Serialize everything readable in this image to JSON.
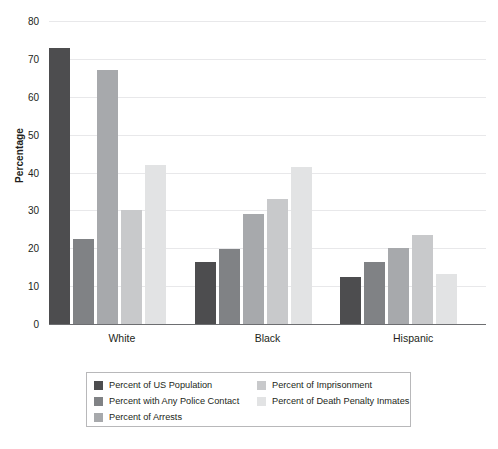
{
  "chart_data": {
    "type": "bar",
    "title": "",
    "subtitle": "",
    "xlabel": "",
    "ylabel": "Percentage",
    "ylim": [
      0,
      80
    ],
    "yticks": [
      0,
      10,
      20,
      30,
      40,
      50,
      60,
      70,
      80
    ],
    "ytick_labels": [
      "0",
      "10",
      "20",
      "30",
      "40",
      "50",
      "60",
      "70",
      "80"
    ],
    "grid": true,
    "legend_position": "bottom",
    "categories": [
      "White",
      "Black",
      "Hispanic"
    ],
    "series": [
      {
        "name": "Percent of US Population",
        "color": "#4d4d4f",
        "values": [
          73.0,
          16.5,
          12.5
        ]
      },
      {
        "name": "Percent with Any Police Contact",
        "color": "#808285",
        "values": [
          22.5,
          19.7,
          16.5
        ]
      },
      {
        "name": "Percent of Arrests",
        "color": "#a7a9ac",
        "values": [
          67.0,
          29.0,
          20.2
        ]
      },
      {
        "name": "Percent of Imprisonment",
        "color": "#c8c9cb",
        "values": [
          30.0,
          33.0,
          23.5
        ]
      },
      {
        "name": "Percent of Death Penalty Inmates",
        "color": "#e2e3e4",
        "values": [
          42.0,
          41.5,
          13.3
        ]
      }
    ]
  },
  "legend": {
    "columns": [
      [
        {
          "label": "Percent of US Population",
          "color": "#4d4d4f"
        },
        {
          "label": "Percent with Any Police Contact",
          "color": "#808285"
        },
        {
          "label": "Percent of Arrests",
          "color": "#a7a9ac"
        }
      ],
      [
        {
          "label": "Percent of Imprisonment",
          "color": "#c8c9cb"
        },
        {
          "label": "Percent of Death Penalty Inmates",
          "color": "#e2e3e4"
        }
      ]
    ]
  },
  "style": {
    "background": "#ffffff",
    "grid_color": "#e8e8ea",
    "axis_color": "#6d6e71",
    "text_color": "#231f20",
    "legend_border": "#b8b8ba"
  }
}
